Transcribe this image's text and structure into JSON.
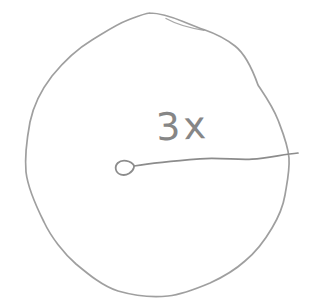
{
  "figure": {
    "kind": "hand-drawn pencil sketch",
    "radius_label": "3x",
    "colors": {
      "background": "#ffffff",
      "pencil_stroke": "#9a9a9a",
      "pencil_dark": "#8c8c8c",
      "label_color": "#7a7a7a"
    }
  }
}
